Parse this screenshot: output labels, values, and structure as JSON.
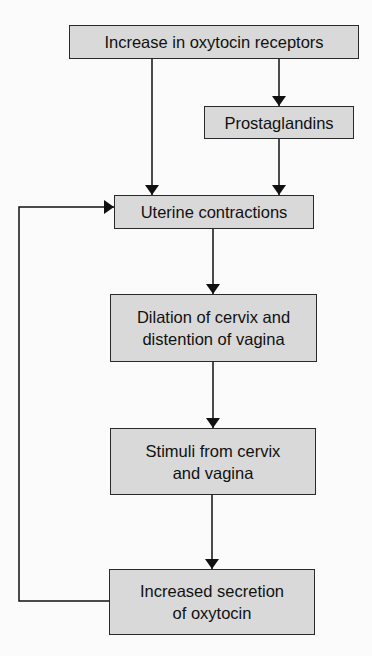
{
  "diagram": {
    "type": "flowchart",
    "colors": {
      "box_fill": "#d9d9d9",
      "border": "#2a2a2a",
      "background": "#fbfbfb"
    },
    "nodes": [
      {
        "id": "receptors",
        "label": "Increase in oxytocin receptors"
      },
      {
        "id": "prostaglandins",
        "label": "Prostaglandins"
      },
      {
        "id": "contractions",
        "label": "Uterine contractions"
      },
      {
        "id": "dilation",
        "label": "Dilation of cervix and distention of vagina"
      },
      {
        "id": "stimuli",
        "label": "Stimuli from cervix and vagina"
      },
      {
        "id": "secretion",
        "label": "Increased secretion of oxytocin"
      }
    ],
    "edges": [
      {
        "from": "receptors",
        "to": "prostaglandins"
      },
      {
        "from": "receptors",
        "to": "contractions"
      },
      {
        "from": "prostaglandins",
        "to": "contractions"
      },
      {
        "from": "contractions",
        "to": "dilation"
      },
      {
        "from": "dilation",
        "to": "stimuli"
      },
      {
        "from": "stimuli",
        "to": "secretion"
      },
      {
        "from": "secretion",
        "to": "contractions",
        "type": "feedback-loop"
      }
    ]
  }
}
